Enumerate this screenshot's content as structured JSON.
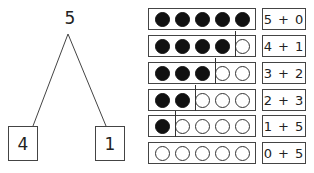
{
  "number_bond": {
    "whole": "5",
    "parts": [
      "4",
      "1"
    ]
  },
  "rows": [
    {
      "filled": 5,
      "empty": 0,
      "expression": "5 + 0"
    },
    {
      "filled": 4,
      "empty": 1,
      "expression": "4 + 1"
    },
    {
      "filled": 3,
      "empty": 2,
      "expression": "3 + 2"
    },
    {
      "filled": 2,
      "empty": 3,
      "expression": "2 + 3"
    },
    {
      "filled": 1,
      "empty": 4,
      "expression": "1 + 5"
    },
    {
      "filled": 0,
      "empty": 5,
      "expression": "0 + 5"
    }
  ],
  "colors": {
    "filled_dot": "#111111",
    "outline": "#444444",
    "background": "#ffffff"
  }
}
